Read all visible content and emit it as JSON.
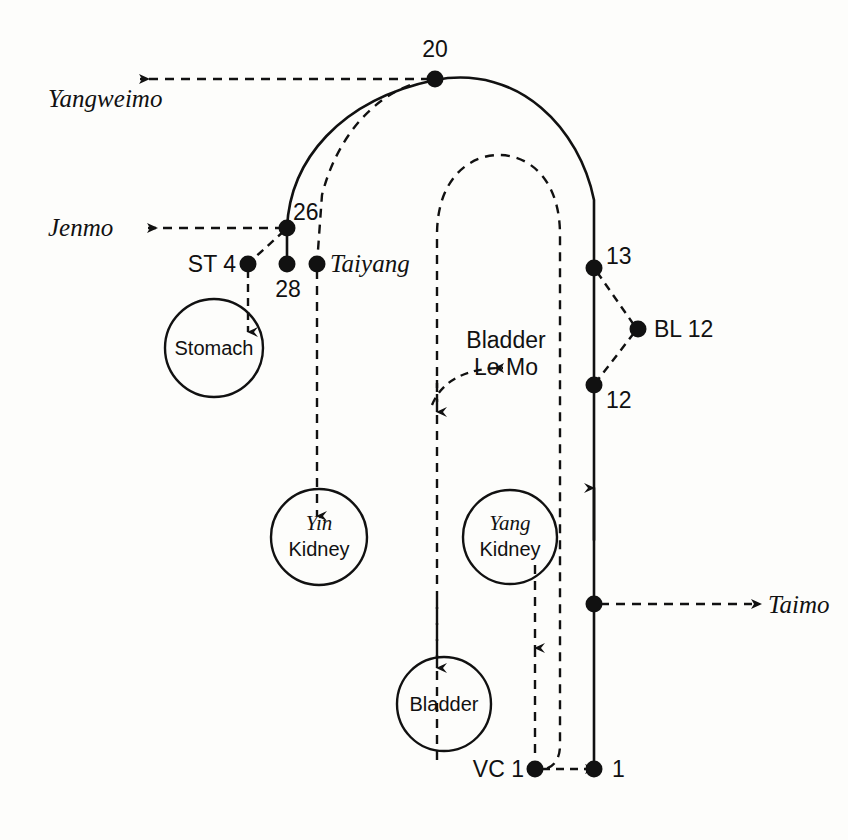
{
  "diagram": {
    "colors": {
      "ink": "#111111",
      "background": "#fdfdfb"
    },
    "points": {
      "p20": "20",
      "p26": "26",
      "p28": "28",
      "p13": "13",
      "p12": "12",
      "p1": "1",
      "st4": "ST 4",
      "bl12": "BL 12",
      "vc1": "VC 1"
    },
    "vessels": {
      "yangweimo": "Yangweimo",
      "jenmo": "Jenmo",
      "taiyang": "Taiyang",
      "taimo": "Taimo"
    },
    "organs": {
      "stomach": "Stomach",
      "yin_kidney_line1": "Yin",
      "yin_kidney_line2": "Kidney",
      "yang_kidney_line1": "Yang",
      "yang_kidney_line2": "Kidney",
      "bladder": "Bladder"
    },
    "annotations": {
      "bladder_lo_mo_line1": "Bladder",
      "bladder_lo_mo_line2": "Lo Mo"
    }
  }
}
